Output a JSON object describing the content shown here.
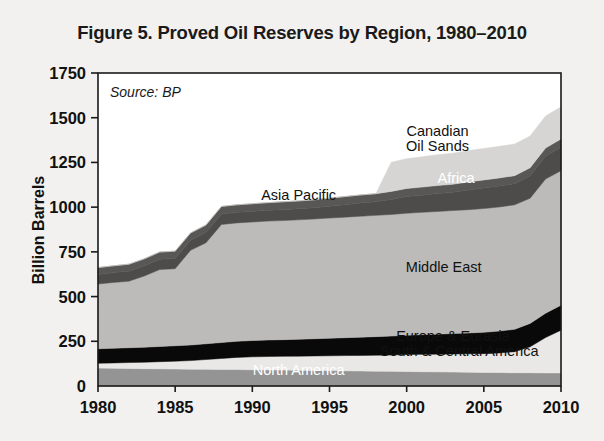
{
  "figure": {
    "title": "Figure 5. Proved Oil Reserves by Region, 1980–2010",
    "source_note": "Source: BP"
  },
  "chart_data": {
    "type": "area",
    "title": "Figure 5. Proved Oil Reserves by Region, 1980–2010",
    "xlabel": "",
    "ylabel": "Billion Barrels",
    "xlim": [
      1980,
      2010
    ],
    "ylim": [
      0,
      1750
    ],
    "ytick_step": 250,
    "yticks": [
      0,
      250,
      500,
      750,
      1000,
      1250,
      1500,
      1750
    ],
    "xticks": [
      1980,
      1985,
      1990,
      1995,
      2000,
      2005,
      2010
    ],
    "grid": false,
    "legend": "inline-annotations",
    "stacked": true,
    "x": [
      1980,
      1981,
      1982,
      1983,
      1984,
      1985,
      1986,
      1987,
      1988,
      1989,
      1990,
      1991,
      1992,
      1993,
      1994,
      1995,
      1996,
      1997,
      1998,
      1999,
      2000,
      2001,
      2002,
      2003,
      2004,
      2005,
      2006,
      2007,
      2008,
      2009,
      2010
    ],
    "series": [
      {
        "name": "North America",
        "color": "#949494",
        "label_color": "#ffffff",
        "values": [
          100,
          99,
          98,
          97,
          96,
          95,
          94,
          93,
          92,
          92,
          91,
          90,
          89,
          88,
          87,
          86,
          85,
          84,
          83,
          82,
          81,
          80,
          79,
          78,
          77,
          76,
          75,
          74,
          74,
          73,
          73
        ]
      },
      {
        "name": "South & Central America",
        "color": "#e9e8e6",
        "label_color": "#111111",
        "values": [
          27,
          30,
          33,
          36,
          40,
          44,
          48,
          55,
          62,
          68,
          72,
          75,
          77,
          79,
          81,
          83,
          85,
          87,
          89,
          91,
          95,
          97,
          99,
          101,
          103,
          105,
          110,
          118,
          145,
          198,
          239
        ]
      },
      {
        "name": "Europe & Eurasia",
        "color": "#090909",
        "label_color": "#111111",
        "values": [
          81,
          82,
          83,
          84,
          85,
          86,
          87,
          88,
          89,
          90,
          91,
          92,
          93,
          94,
          96,
          98,
          100,
          102,
          104,
          106,
          108,
          110,
          112,
          114,
          116,
          119,
          122,
          125,
          131,
          136,
          140
        ]
      },
      {
        "name": "Middle East",
        "color": "#bcbbb9",
        "label_color": "#111111",
        "values": [
          362,
          368,
          372,
          398,
          430,
          431,
          530,
          565,
          660,
          662,
          663,
          665,
          666,
          668,
          670,
          672,
          674,
          676,
          678,
          680,
          682,
          684,
          686,
          688,
          690,
          692,
          694,
          696,
          700,
          750,
          752
        ]
      },
      {
        "name": "Africa",
        "color": "#4d4c4a",
        "label_color": "#ffffff",
        "values": [
          54,
          55,
          56,
          57,
          58,
          58,
          56,
          58,
          59,
          59,
          59,
          60,
          61,
          62,
          63,
          66,
          70,
          74,
          76,
          84,
          93,
          96,
          100,
          102,
          110,
          115,
          117,
          118,
          125,
          128,
          132
        ]
      },
      {
        "name": "Asia Pacific",
        "color": "#585755",
        "label_color": "#111111",
        "values": [
          38,
          38,
          39,
          39,
          40,
          40,
          41,
          41,
          42,
          42,
          43,
          43,
          44,
          44,
          44,
          45,
          45,
          45,
          45,
          45,
          45,
          45,
          45,
          45,
          45,
          45,
          45,
          45,
          45,
          45,
          45
        ]
      },
      {
        "name": "Canadian Oil Sands",
        "color": "#d6d5d3",
        "label_color": "#111111",
        "values": [
          0,
          0,
          0,
          0,
          0,
          0,
          0,
          0,
          0,
          0,
          0,
          0,
          0,
          0,
          0,
          0,
          0,
          0,
          0,
          163,
          167,
          170,
          172,
          174,
          175,
          176,
          177,
          177,
          178,
          179,
          180
        ]
      }
    ],
    "annotations": [
      {
        "text": "Canadian",
        "x": 2002.0,
        "y": 1395
      },
      {
        "text": "Oil Sands",
        "x": 2002.0,
        "y": 1315
      },
      {
        "text": "Africa",
        "x": 2003.2,
        "y": 1135
      },
      {
        "text": "Asia Pacific",
        "x": 1993.0,
        "y": 1040
      },
      {
        "text": "Middle East",
        "x": 2002.4,
        "y": 640
      },
      {
        "text": "Europe & Eurasia",
        "x": 2003.0,
        "y": 253
      },
      {
        "text": "South & Central America",
        "x": 2003.4,
        "y": 168
      },
      {
        "text": "North America",
        "x": 1993.0,
        "y": 62
      }
    ]
  }
}
